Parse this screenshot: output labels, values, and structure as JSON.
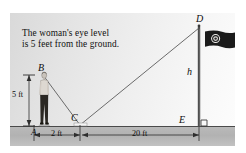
{
  "figure": {
    "caption_line1": "The woman's eye level",
    "caption_line2": "is 5 feet from the ground.",
    "labels": {
      "point_a": "A",
      "point_b": "B",
      "point_c": "C",
      "point_d": "D",
      "point_e": "E",
      "height_var": "h"
    },
    "dimensions": {
      "eye_height": "5 ft",
      "base_to_mirror": "2 ft",
      "mirror_to_pole": "20 ft"
    },
    "icons": {
      "woman": "woman-figure-icon",
      "flag": "flag-icon",
      "flagpole": "flagpole-icon",
      "right_angle": "right-angle-marker-icon",
      "mirror": "mirror-icon"
    },
    "colors": {
      "sky": "#efefef",
      "ground": "#b5b5b5",
      "line": "#5a5a5a",
      "flag": "#1b1b1b",
      "text": "#0d0d0d"
    }
  }
}
